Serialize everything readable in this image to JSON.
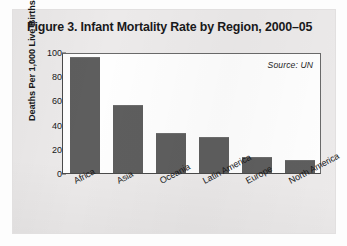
{
  "figure": {
    "title": "Figure 3. Infant Mortality Rate by Region, 2000–05",
    "source_note": "Source: UN"
  },
  "chart_data": {
    "type": "bar",
    "title": "Figure 3. Infant Mortality Rate by Region, 2000–05",
    "xlabel": "",
    "ylabel": "Deaths Per 1,000 Live Births",
    "ylim": [
      0,
      100
    ],
    "yticks": [
      0,
      20,
      40,
      60,
      80,
      100
    ],
    "ytick_labels": [
      "0",
      "20",
      "40",
      "60",
      "80",
      "100"
    ],
    "grid": false,
    "legend": false,
    "annotation": "Source: UN",
    "annotation_position": "top-right",
    "bar_color": "#5e5e5e",
    "categories": [
      "Africa",
      "Asia",
      "Oceania",
      "Latin America",
      "Europe",
      "North America"
    ],
    "values": [
      96,
      56,
      33,
      30,
      13,
      11
    ]
  }
}
